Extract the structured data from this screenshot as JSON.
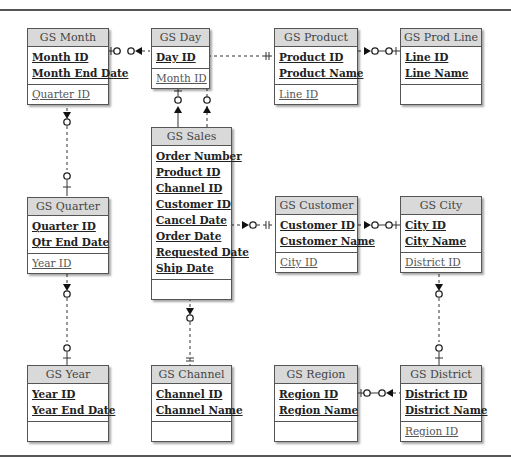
{
  "diagram": {
    "type": "entity-relationship",
    "entities": {
      "month": {
        "name": "GS Month",
        "keys": [
          "Month ID",
          "Month End Date"
        ],
        "attrs": [
          "Quarter ID"
        ]
      },
      "day": {
        "name": "GS Day",
        "keys": [
          "Day ID"
        ],
        "attrs": [
          "Month ID"
        ]
      },
      "product": {
        "name": "GS Product",
        "keys": [
          "Product ID",
          "Product Name"
        ],
        "attrs": [
          "Line ID"
        ]
      },
      "prodline": {
        "name": "GS Prod Line",
        "keys": [
          "Line ID",
          "Line Name"
        ],
        "attrs": []
      },
      "quarter": {
        "name": "GS Quarter",
        "keys": [
          "Quarter ID",
          "Qtr End Date"
        ],
        "attrs": [
          "Year ID"
        ]
      },
      "sales": {
        "name": "GS Sales",
        "keys": [
          "Order Number",
          "Product ID",
          "Channel ID",
          "Customer ID",
          "Cancel Date",
          "Order Date",
          "Requested Date",
          "Ship Date"
        ],
        "attrs": []
      },
      "customer": {
        "name": "GS Customer",
        "keys": [
          "Customer ID",
          "Customer Name"
        ],
        "attrs": [
          "City ID"
        ]
      },
      "city": {
        "name": "GS City",
        "keys": [
          "City ID",
          "City Name"
        ],
        "attrs": [
          "District ID"
        ]
      },
      "year": {
        "name": "GS Year",
        "keys": [
          "Year ID",
          "Year End Date"
        ],
        "attrs": []
      },
      "channel": {
        "name": "GS Channel",
        "keys": [
          "Channel ID",
          "Channel Name"
        ],
        "attrs": []
      },
      "region": {
        "name": "GS Region",
        "keys": [
          "Region ID",
          "Region Name"
        ],
        "attrs": []
      },
      "district": {
        "name": "GS District",
        "keys": [
          "District ID",
          "District Name"
        ],
        "attrs": [
          "Region ID"
        ]
      }
    },
    "relationships": [
      {
        "from": "GS Month",
        "to": "GS Day",
        "one_side": "GS Month",
        "many_side": "GS Day"
      },
      {
        "from": "GS Day",
        "to": "GS Sales",
        "one_side": "GS Day",
        "many_side": "GS Sales"
      },
      {
        "from": "GS Product",
        "to": "GS Sales",
        "one_side": "GS Product",
        "many_side": "GS Sales"
      },
      {
        "from": "GS Prod Line",
        "to": "GS Product",
        "one_side": "GS Prod Line",
        "many_side": "GS Product"
      },
      {
        "from": "GS Month",
        "to": "GS Quarter",
        "one_side": "GS Quarter",
        "many_side": "GS Month"
      },
      {
        "from": "GS Quarter",
        "to": "GS Year",
        "one_side": "GS Year",
        "many_side": "GS Quarter"
      },
      {
        "from": "GS Sales",
        "to": "GS Customer",
        "one_side": "GS Customer",
        "many_side": "GS Sales"
      },
      {
        "from": "GS Customer",
        "to": "GS City",
        "one_side": "GS City",
        "many_side": "GS Customer"
      },
      {
        "from": "GS City",
        "to": "GS District",
        "one_side": "GS District",
        "many_side": "GS City"
      },
      {
        "from": "GS Sales",
        "to": "GS Channel",
        "one_side": "GS Channel",
        "many_side": "GS Sales"
      },
      {
        "from": "GS District",
        "to": "GS Region",
        "one_side": "GS Region",
        "many_side": "GS District"
      }
    ]
  }
}
